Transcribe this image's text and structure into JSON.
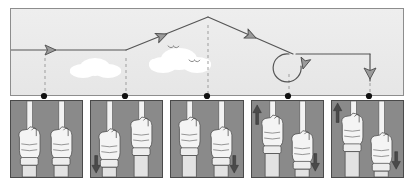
{
  "figure": {
    "sky": {
      "background_color": "#ebebeb",
      "border_color": "#8d8d8d",
      "cloud_color": "#ffffff",
      "line_color": "#555555",
      "arrow_fill": "#9a9a9a",
      "dashed_color": "#9a9a9a",
      "dot_color": "#000000",
      "clouds": [
        {
          "name": "cloud-left",
          "cx": 82,
          "cy": 68
        },
        {
          "name": "cloud-right",
          "cx": 175,
          "cy": 62
        }
      ],
      "birds": [
        {
          "name": "bird-upper",
          "cx": 172,
          "cy": 46
        },
        {
          "name": "bird-lower",
          "cx": 193,
          "cy": 60
        }
      ],
      "flight_path": {
        "type": "polyline-with-loop",
        "segments": [
          {
            "name": "level-entry",
            "from": [
              10,
              49
            ],
            "to": [
              125,
              49
            ],
            "direction": "right"
          },
          {
            "name": "climb",
            "from": [
              125,
              49
            ],
            "to": [
              207,
              16
            ],
            "direction": "up-right"
          },
          {
            "name": "descent",
            "from": [
              207,
              16
            ],
            "to": [
              288,
              52
            ],
            "direction": "down-right"
          },
          {
            "name": "loop",
            "center": [
              288,
              65
            ],
            "radius": 15,
            "direction": "clockwise"
          },
          {
            "name": "level-exit",
            "from": [
              300,
              52
            ],
            "to": [
              369,
              52
            ],
            "direction": "right"
          },
          {
            "name": "dive-to-ground",
            "from": [
              369,
              52
            ],
            "to": [
              369,
              88
            ],
            "direction": "down"
          }
        ],
        "arrow_markers": [
          {
            "name": "arrow-level-entry",
            "x": 47,
            "y": 49,
            "angle": 0
          },
          {
            "name": "arrow-climb",
            "x": 155,
            "y": 37,
            "angle": -22
          },
          {
            "name": "arrow-descent",
            "x": 243,
            "y": 32,
            "angle": 24
          },
          {
            "name": "arrow-loop-exit",
            "x": 300,
            "y": 72,
            "angle": 100
          },
          {
            "name": "arrow-dive",
            "x": 369,
            "y": 76,
            "angle": 90
          }
        ]
      },
      "tick_dots": [
        {
          "name": "tick-dot-1",
          "x": 44,
          "y": 96
        },
        {
          "name": "tick-dot-2",
          "x": 125,
          "y": 96
        },
        {
          "name": "tick-dot-3",
          "x": 207,
          "y": 96
        },
        {
          "name": "tick-dot-4",
          "x": 288,
          "y": 96
        },
        {
          "name": "tick-dot-5",
          "x": 369,
          "y": 96
        }
      ]
    },
    "panels": {
      "background_color": "#8a8a8a",
      "border_color": "#4a4a4a",
      "hand_fill": "#f4f4f4",
      "hand_outline": "#4e4e4e",
      "stick_fill": "#f2f2f2",
      "arrow_fill": "#4a4a4a",
      "items": [
        {
          "name": "panel-1-neutral",
          "caption": "",
          "left_hand": "neutral",
          "right_hand": "neutral",
          "left_stick_offset": 0,
          "right_stick_offset": 0,
          "left_arrow": "none",
          "right_arrow": "none"
        },
        {
          "name": "panel-2-right-stick-back",
          "caption": "",
          "left_hand": "neutral",
          "right_hand": "raised",
          "left_stick_offset": 0,
          "right_stick_offset": -10,
          "left_arrow": "down",
          "right_arrow": "none"
        },
        {
          "name": "panel-3-left-stick-back",
          "caption": "",
          "left_hand": "raised",
          "right_hand": "neutral",
          "left_stick_offset": -10,
          "right_stick_offset": 0,
          "left_arrow": "none",
          "right_arrow": "down"
        },
        {
          "name": "panel-4-left-up-right-down",
          "caption": "",
          "left_hand": "raised",
          "right_hand": "lowered",
          "left_stick_offset": -10,
          "right_stick_offset": 8,
          "left_arrow": "up",
          "right_arrow": "down"
        },
        {
          "name": "panel-5-left-up-right-down",
          "caption": "",
          "left_hand": "raised",
          "right_hand": "lowered",
          "left_stick_offset": -12,
          "right_stick_offset": 10,
          "left_arrow": "up",
          "right_arrow": "down"
        }
      ]
    }
  }
}
